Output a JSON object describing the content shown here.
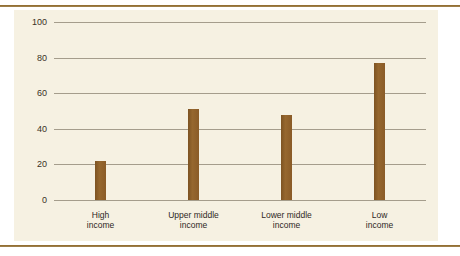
{
  "figure": {
    "background_color": "#ffffff",
    "panel_color": "#f6f1e2",
    "rule_color": "#8a6a2e",
    "bar_color": "#8a5b27",
    "gridline_color": "#a59d8c",
    "tick_text_color": "#3a3226"
  },
  "chart_data": {
    "type": "bar",
    "title": "",
    "subtitle": "",
    "xlabel": "",
    "ylabel": "",
    "categories": [
      "High income",
      "Upper middle income",
      "Lower middle income",
      "Low income"
    ],
    "category_lines": [
      [
        "High",
        "income"
      ],
      [
        "Upper middle",
        "income"
      ],
      [
        "Lower middle",
        "income"
      ],
      [
        "Low",
        "income"
      ]
    ],
    "values": [
      22,
      51,
      48,
      77
    ],
    "ylim": [
      0,
      100
    ],
    "yticks": [
      0,
      20,
      40,
      60,
      80,
      100
    ],
    "ytick_labels": [
      "0",
      "20",
      "40",
      "60",
      "80",
      "100"
    ],
    "grid": true,
    "grid_axis": "y",
    "legend": false,
    "legend_position": "none",
    "series": [
      {
        "name": "",
        "values": [
          22,
          51,
          48,
          77
        ],
        "color": "#8a5b27"
      }
    ]
  }
}
